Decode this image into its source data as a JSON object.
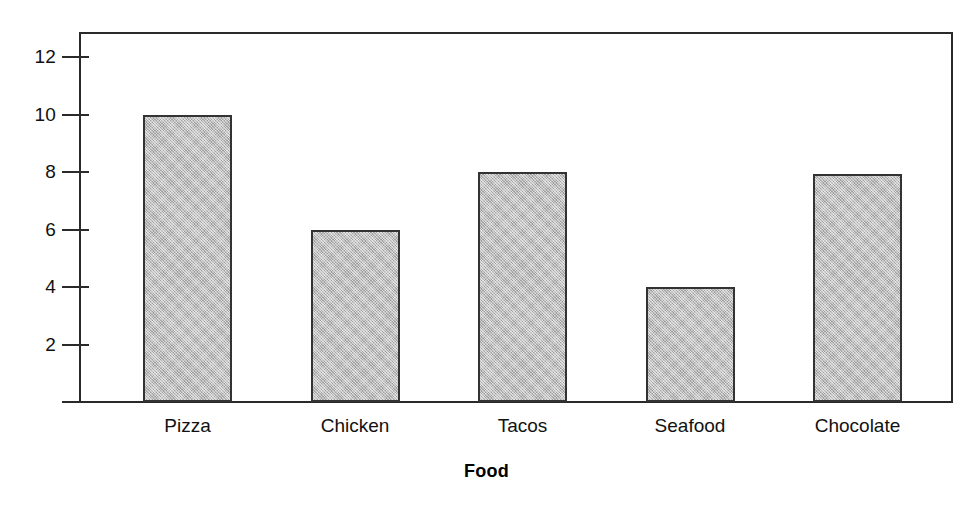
{
  "chart_data": {
    "type": "bar",
    "title": "",
    "subtitle": "",
    "xlabel": "Food",
    "ylabel": "",
    "categories": [
      "Pizza",
      "Chicken",
      "Tacos",
      "Seafood",
      "Chocolate"
    ],
    "values": [
      10,
      6,
      8,
      4,
      7.95
    ],
    "ytick_labels": [
      "12",
      "10",
      "8",
      "6",
      "4",
      "2"
    ],
    "ytick_values": [
      12,
      10,
      8,
      6,
      4,
      2
    ],
    "ylim": [
      0,
      13
    ],
    "xlim_categories": 5,
    "grid": false,
    "legend": null,
    "legend_position": "none",
    "annotations": [],
    "colors": {
      "bar_fill": "#b3b3b3",
      "bar_outline": "#333333",
      "axis": "#2a2a2a",
      "text": "#111111",
      "background": "#ffffff"
    }
  },
  "axis": {
    "y_ticks": [
      {
        "label": "12",
        "value": 12
      },
      {
        "label": "10",
        "value": 10
      },
      {
        "label": "8",
        "value": 8
      },
      {
        "label": "6",
        "value": 6
      },
      {
        "label": "4",
        "value": 4
      },
      {
        "label": "2",
        "value": 2
      }
    ],
    "x_title": "Food"
  },
  "bars": [
    {
      "label": "Pizza",
      "value": 10
    },
    {
      "label": "Chicken",
      "value": 6
    },
    {
      "label": "Tacos",
      "value": 8
    },
    {
      "label": "Seafood",
      "value": 4
    },
    {
      "label": "Chocolate",
      "value": 7.95
    }
  ]
}
